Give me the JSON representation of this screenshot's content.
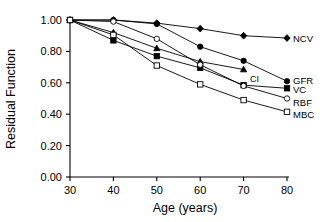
{
  "chart_data": {
    "type": "line",
    "title": "",
    "xlabel": "Age (years)",
    "ylabel": "Residual Function",
    "xlim": [
      30,
      80
    ],
    "ylim": [
      0.0,
      1.0
    ],
    "xticks": [
      30,
      40,
      50,
      60,
      70,
      80
    ],
    "xticklabels": [
      "30",
      "40",
      "50",
      "60",
      "70",
      "80"
    ],
    "yticks": [
      0.0,
      0.2,
      0.4,
      0.6,
      0.8,
      1.0
    ],
    "yticklabels": [
      "0.00",
      "0.20",
      "0.40",
      "0.60",
      "0.80",
      "1.00"
    ],
    "grid": false,
    "legend_position": "right-inline-labels",
    "x": [
      30,
      40,
      50,
      60,
      70,
      80
    ],
    "series": [
      {
        "name": "NCV",
        "label": "NCV",
        "marker": "filled-diamond",
        "color": "#000000",
        "x": [
          30,
          40,
          50,
          60,
          70,
          80
        ],
        "values": [
          1.0,
          1.0,
          0.98,
          0.945,
          0.9,
          0.885
        ]
      },
      {
        "name": "GFR",
        "label": "GFR",
        "marker": "filled-circle",
        "color": "#000000",
        "x": [
          30,
          40,
          50,
          60,
          70,
          80
        ],
        "values": [
          1.0,
          1.0,
          0.975,
          0.83,
          0.74,
          0.61
        ]
      },
      {
        "name": "CI",
        "label": "CI",
        "marker": "filled-triangle",
        "color": "#000000",
        "x": [
          30,
          40,
          50,
          60,
          70
        ],
        "values": [
          1.0,
          0.92,
          0.82,
          0.735,
          0.685
        ]
      },
      {
        "name": "VC",
        "label": "VC",
        "marker": "filled-square",
        "color": "#000000",
        "x": [
          30,
          40,
          50,
          60,
          70,
          80
        ],
        "values": [
          1.0,
          0.87,
          0.77,
          0.695,
          0.585,
          0.565
        ]
      },
      {
        "name": "RBF",
        "label": "RBF",
        "marker": "open-circle",
        "color": "#000000",
        "x": [
          30,
          40,
          50,
          60,
          70,
          80
        ],
        "values": [
          1.0,
          0.99,
          0.88,
          0.715,
          0.58,
          0.5
        ]
      },
      {
        "name": "MBC",
        "label": "MBC",
        "marker": "open-square",
        "color": "#000000",
        "x": [
          30,
          40,
          50,
          60,
          70,
          80
        ],
        "values": [
          1.0,
          0.905,
          0.71,
          0.59,
          0.49,
          0.415
        ]
      }
    ]
  },
  "labels": {
    "ylabel": "Residual Function",
    "xlabel": "Age (years)",
    "series_labels": [
      "NCV",
      "CI",
      "GFR",
      "VC",
      "RBF",
      "MBC"
    ]
  }
}
